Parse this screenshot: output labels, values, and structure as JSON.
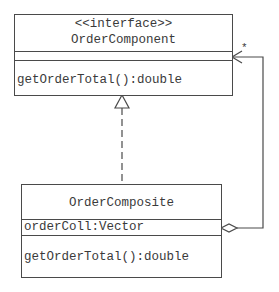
{
  "diagram": {
    "type": "UML class diagram",
    "classes": [
      {
        "id": "order-component",
        "stereotype": "<<interface>>",
        "name": "OrderComponent",
        "attributes": [],
        "operations": [
          "getOrderTotal():double"
        ]
      },
      {
        "id": "order-composite",
        "stereotype": "",
        "name": "OrderComposite",
        "attributes": [
          "orderColl:Vector"
        ],
        "operations": [
          "getOrderTotal():double"
        ]
      }
    ],
    "relationships": [
      {
        "type": "realization",
        "from": "OrderComposite",
        "to": "OrderComponent"
      },
      {
        "type": "aggregation",
        "from": "OrderComposite",
        "to": "OrderComponent",
        "multiplicity": "*"
      }
    ],
    "colors": {
      "line": "#4a4a4a",
      "text": "#3a3a3a",
      "background": "#ffffff"
    }
  }
}
